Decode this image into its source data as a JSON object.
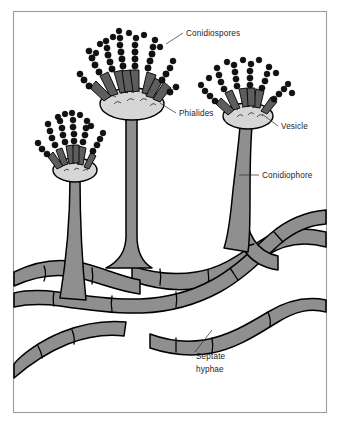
{
  "figure": {
    "background_color": "#ffffff",
    "frame": {
      "stroke": "#9a9a9a",
      "x": 13,
      "y": 11,
      "width": 314,
      "height": 402
    }
  },
  "palette": {
    "hypha_fill": "#8f8f8f",
    "stalk_fill": "#8f8f8f",
    "vesicle_fill": "#d6d6d6",
    "phialide_fill": "#5d5d5d",
    "spore_fill": "#111111",
    "outline": "#000000",
    "label_text": "#1c1c1c",
    "leader_line": "#2a2a2a"
  },
  "labels": [
    {
      "id": "conidiospores",
      "text": "Conidiospores",
      "x": 186,
      "y": 36,
      "anchor": "start",
      "leader": {
        "x1": 183,
        "y1": 33,
        "x2": 166,
        "y2": 44
      }
    },
    {
      "id": "phialides",
      "text": "Phialides",
      "x": 179,
      "y": 116,
      "anchor": "start",
      "leader": {
        "x1": 176,
        "y1": 113,
        "x2": 160,
        "y2": 103
      }
    },
    {
      "id": "vesicle",
      "text": "Vesicle",
      "x": 281,
      "y": 129,
      "anchor": "start",
      "leader": {
        "x1": 278,
        "y1": 126,
        "x2": 262,
        "y2": 114
      }
    },
    {
      "id": "conidiophore",
      "text": "Conidiophore",
      "x": 262,
      "y": 178,
      "anchor": "start",
      "leader": {
        "x1": 259,
        "y1": 175,
        "x2": 239,
        "y2": 175
      }
    },
    {
      "id": "septate-hyphae",
      "text": "Septate",
      "text_line2": "hyphae",
      "x": 196,
      "y": 359,
      "anchor": "start",
      "leader": {
        "x1": 195,
        "y1": 352,
        "x2": 212,
        "y2": 330
      }
    }
  ],
  "structures": {
    "conidial_heads": [
      {
        "id": "head-left",
        "label": "small left conidial head",
        "cx": 79,
        "cy": 154,
        "scale": 0.7
      },
      {
        "id": "head-center",
        "label": "tall center conidial head",
        "cx": 133,
        "cy": 88,
        "scale": 1.0
      },
      {
        "id": "head-right",
        "label": "right conidial head",
        "cx": 249,
        "cy": 100,
        "scale": 0.82
      }
    ],
    "conidiophore_stalks": [
      {
        "id": "stalk-left",
        "label": "left conidiophore stalk"
      },
      {
        "id": "stalk-center",
        "label": "center conidiophore stalk"
      },
      {
        "id": "stalk-right",
        "label": "right conidiophore stalk"
      }
    ],
    "hyphae_count": 6,
    "hyphae_note": "interwoven septate hyphal network forming the mycelium"
  }
}
